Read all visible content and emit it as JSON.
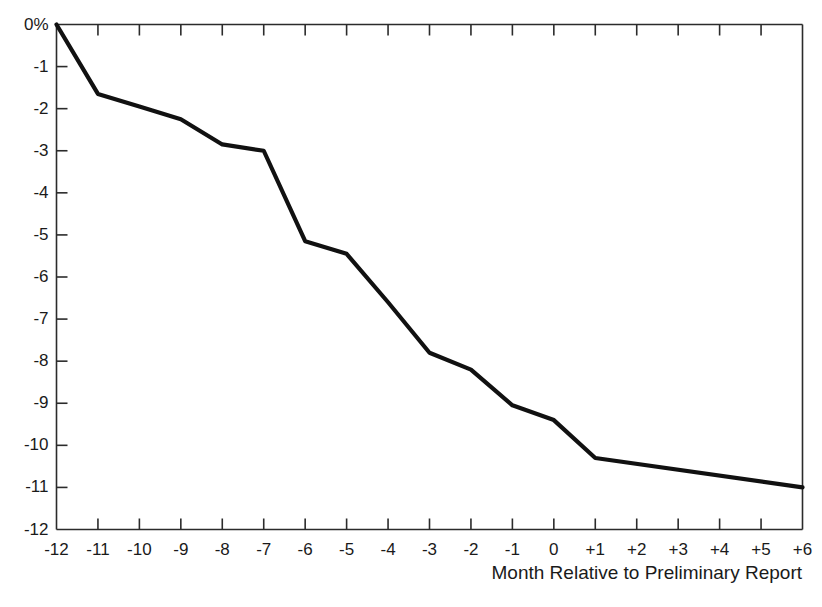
{
  "chart_data": {
    "type": "line",
    "title": "",
    "xlabel": "Month Relative to Preliminary Report",
    "ylabel": "",
    "x": [
      -12,
      -11,
      -10,
      -9,
      -8,
      -7,
      -6,
      -5,
      -4,
      -3,
      -2,
      -1,
      0,
      1,
      6
    ],
    "values": [
      0,
      -1.65,
      -1.95,
      -2.25,
      -2.85,
      -3.0,
      -5.15,
      -5.45,
      -6.6,
      -7.8,
      -8.2,
      -9.05,
      -9.4,
      -10.3,
      -11.0
    ],
    "series": [
      {
        "name": "Cumulative abnormal return",
        "values": [
          0,
          -1.65,
          -1.95,
          -2.25,
          -2.85,
          -3.0,
          -5.15,
          -5.45,
          -6.6,
          -7.8,
          -8.2,
          -9.05,
          -9.4,
          -10.3,
          -11.0
        ]
      }
    ],
    "xlim": [
      -12,
      6
    ],
    "ylim": [
      -12,
      0
    ],
    "xticks": [
      -12,
      -11,
      -10,
      -9,
      -8,
      -7,
      -6,
      -5,
      -4,
      -3,
      -2,
      -1,
      0,
      1,
      2,
      3,
      4,
      5,
      6
    ],
    "xtick_labels": [
      "-12",
      "-11",
      "-10",
      "-9",
      "-8",
      "-7",
      "-6",
      "-5",
      "-4",
      "-3",
      "-2",
      "-1",
      "0",
      "+1",
      "+2",
      "+3",
      "+4",
      "+5",
      "+6"
    ],
    "yticks": [
      0,
      -1,
      -2,
      -3,
      -4,
      -5,
      -6,
      -7,
      -8,
      -9,
      -10,
      -11,
      -12
    ],
    "ytick_labels": [
      "0%",
      "-1",
      "-2",
      "-3",
      "-4",
      "-5",
      "-6",
      "-7",
      "-8",
      "-9",
      "-10",
      "-11",
      "-12"
    ],
    "grid": false,
    "legend": "none",
    "line_color": "#111111",
    "axis_color": "#2b2b2b"
  }
}
